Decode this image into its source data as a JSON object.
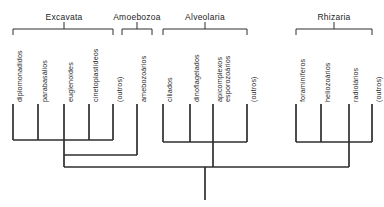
{
  "figure": {
    "kind": "cladogram"
  },
  "clades": [
    {
      "id": "excavata",
      "name": "Excavata",
      "label_x": 64,
      "label_y": 12,
      "bracket_left": 13,
      "bracket_right": 113,
      "bracket_y": 29,
      "tick_x": 64
    },
    {
      "id": "amoebozoa",
      "name": "Amoebozoa",
      "label_x": 137,
      "label_y": 12,
      "bracket_left": 122,
      "bracket_right": 152,
      "bracket_y": 29,
      "tick_x": 137
    },
    {
      "id": "alveolaria",
      "name": "Alveolaria",
      "label_x": 205,
      "label_y": 12,
      "bracket_left": 163,
      "bracket_right": 247,
      "bracket_y": 29,
      "tick_x": 205
    },
    {
      "id": "rhizaria",
      "name": "Rhizaria",
      "label_x": 334,
      "label_y": 12,
      "bracket_left": 296,
      "bracket_right": 372,
      "bracket_y": 29,
      "tick_x": 334
    }
  ],
  "tips": [
    {
      "id": "diplomonadidos",
      "label": "diplomonadidos",
      "x": 13,
      "label_y": 102,
      "top": 104,
      "bottom": 140
    },
    {
      "id": "parabasalios",
      "label": "parabasálios",
      "x": 38,
      "label_y": 102,
      "top": 104,
      "bottom": 140
    },
    {
      "id": "euglenoides",
      "label": "euglenoides",
      "x": 64,
      "label_y": 102,
      "top": 104,
      "bottom": 140
    },
    {
      "id": "cinetoplastideos",
      "label": "cinetoplastídeos",
      "x": 89,
      "label_y": 102,
      "top": 104,
      "bottom": 140
    },
    {
      "id": "outros-excavata",
      "label": "(outros)",
      "x": 113,
      "label_y": 102,
      "top": 104,
      "bottom": 140
    },
    {
      "id": "amebozoarios",
      "label": "amebozoários",
      "x": 137,
      "label_y": 102,
      "top": 104,
      "bottom": 155
    },
    {
      "id": "ciliados",
      "label": "ciliados",
      "x": 163,
      "label_y": 102,
      "top": 104,
      "bottom": 142
    },
    {
      "id": "dinoflagelados",
      "label": "dinoflagelados",
      "x": 190,
      "label_y": 102,
      "top": 104,
      "bottom": 142
    },
    {
      "id": "apicomplexos",
      "label": "apicomplexos\nesporozoários",
      "x": 213,
      "label_y": 102,
      "top": 104,
      "bottom": 142
    },
    {
      "id": "outros-alveolaria",
      "label": "(outros)",
      "x": 247,
      "label_y": 102,
      "top": 104,
      "bottom": 142
    },
    {
      "id": "foraminiferos",
      "label": "foraminíferos",
      "x": 296,
      "label_y": 102,
      "top": 104,
      "bottom": 142
    },
    {
      "id": "heliozoarios",
      "label": "heliozoários",
      "x": 321,
      "label_y": 102,
      "top": 104,
      "bottom": 142
    },
    {
      "id": "radiolarios",
      "label": "radiolários",
      "x": 349,
      "label_y": 102,
      "top": 104,
      "bottom": 142
    },
    {
      "id": "outros-rhizaria",
      "label": "(outros)",
      "x": 372,
      "label_y": 102,
      "top": 104,
      "bottom": 142
    }
  ],
  "internal_bars": [
    {
      "id": "bar-excavata",
      "x1": 13,
      "x2": 113,
      "y": 140
    },
    {
      "id": "bar-alveolaria",
      "x1": 163,
      "x2": 247,
      "y": 142
    },
    {
      "id": "bar-rhizaria",
      "x1": 296,
      "x2": 372,
      "y": 142
    },
    {
      "id": "bar-mid",
      "x1": 64,
      "x2": 137,
      "y": 155
    },
    {
      "id": "bar-root",
      "x1": 64,
      "x2": 349,
      "y": 167
    }
  ],
  "stems": [
    {
      "id": "stem-excavata",
      "x": 64,
      "y1": 140,
      "y2": 155
    },
    {
      "id": "stem-mid",
      "x": 64,
      "y1": 155,
      "y2": 167
    },
    {
      "id": "stem-alveolaria",
      "x": 213,
      "y1": 142,
      "y2": 167
    },
    {
      "id": "stem-rhizaria",
      "x": 349,
      "y1": 142,
      "y2": 167
    },
    {
      "id": "stem-root",
      "x": 205,
      "y1": 167,
      "y2": 200
    }
  ],
  "colors": {
    "branch": "#2e2e2e",
    "bracket": "#4a4a4a",
    "label": "#2b2b2b",
    "clade_label": "#1d1d1d",
    "background": "#ffffff"
  }
}
